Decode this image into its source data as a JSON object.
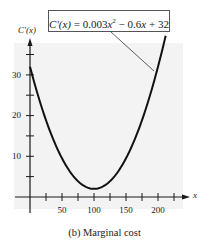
{
  "chart_data": {
    "type": "line",
    "title": "",
    "caption": "(b) Marginal cost",
    "xlabel": "x",
    "ylabel": "C'(x)",
    "annotation": "C'(x) = 0.003x² − 0.6x + 32",
    "function": "0.003*x^2 - 0.6*x + 32",
    "x_ticks": [
      25,
      50,
      75,
      100,
      125,
      150,
      175,
      200,
      225
    ],
    "x_tick_labels": [
      "50",
      "100",
      "150",
      "200"
    ],
    "y_ticks": [
      5,
      10,
      15,
      20,
      25,
      30,
      35
    ],
    "y_tick_labels": [
      "10",
      "20",
      "30"
    ],
    "xlim": [
      0,
      235
    ],
    "ylim": [
      0,
      38
    ],
    "grid": false,
    "series": [
      {
        "name": "C'(x)",
        "x": [
          0,
          20,
          40,
          60,
          80,
          100,
          120,
          140,
          160,
          180,
          200,
          212
        ],
        "values": [
          32,
          21.2,
          12.8,
          6.8,
          3.2,
          2,
          3.2,
          6.8,
          12.8,
          21.2,
          32,
          39.6
        ]
      }
    ]
  },
  "labels": {
    "y_axis_title": "C'(x)",
    "x_axis_title": "x",
    "y_ticks": {
      "t10": "10",
      "t20": "20",
      "t30": "30"
    },
    "x_ticks": {
      "t50": "50",
      "t100": "100",
      "t150": "150",
      "t200": "200"
    },
    "eq_lhs": "C'(x)",
    "eq_rhs_pre": " = 0.003",
    "eq_x1": "x",
    "eq_sup": "2",
    "eq_mid": " − 0.6",
    "eq_x2": "x",
    "eq_tail": " + 32",
    "caption": "(b) Marginal cost"
  }
}
